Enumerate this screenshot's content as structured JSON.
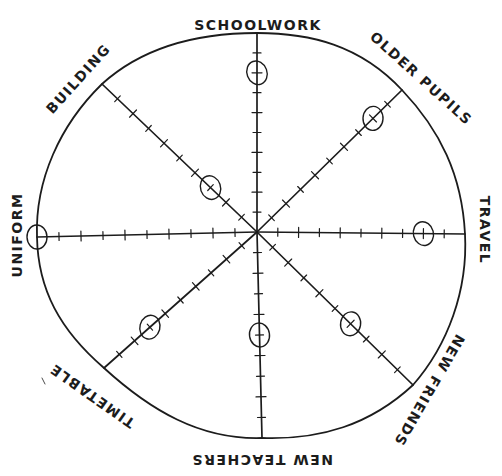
{
  "diagram": {
    "type": "radar-wheel",
    "style": "hand-drawn",
    "center": [
      257,
      232
    ],
    "scale_ticks": 10,
    "colors": {
      "ink": "#1c1c1c",
      "background": "#ffffff"
    },
    "axes": [
      {
        "id": "schoolwork",
        "label": "SCHOOLWORK",
        "end": [
          257,
          33
        ],
        "value": 8,
        "label_pos": [
          258,
          30
        ],
        "label_rot": 0
      },
      {
        "id": "older-pupils",
        "label": "OLDER PUPILS",
        "end": [
          402,
          90
        ],
        "value": 8,
        "label_pos": [
          418,
          82
        ],
        "label_rot": 42
      },
      {
        "id": "travel",
        "label": "TRAVEL",
        "end": [
          465,
          234
        ],
        "value": 8,
        "label_pos": [
          480,
          230
        ],
        "label_rot": 90
      },
      {
        "id": "new-friends",
        "label": "NEW FRIENDS",
        "end": [
          413,
          385
        ],
        "value": 6,
        "label_pos": [
          425,
          388
        ],
        "label_rot": 120
      },
      {
        "id": "new-teachers",
        "label": "NEW TEACHERS",
        "end": [
          262,
          438
        ],
        "value": 5,
        "label_pos": [
          262,
          455
        ],
        "label_rot": 180
      },
      {
        "id": "timetable",
        "label": "TIMETABLE",
        "end": [
          104,
          368
        ],
        "value": 7,
        "label_pos": [
          95,
          392
        ],
        "label_rot": 215
      },
      {
        "id": "uniform",
        "label": "UNIFORM",
        "end": [
          37,
          237
        ],
        "value": 10,
        "label_pos": [
          22,
          235
        ],
        "label_rot": -90
      },
      {
        "id": "building",
        "label": "BUILDING",
        "end": [
          102,
          84
        ],
        "value": 3,
        "label_pos": [
          82,
          82
        ],
        "label_rot": -48
      }
    ]
  }
}
